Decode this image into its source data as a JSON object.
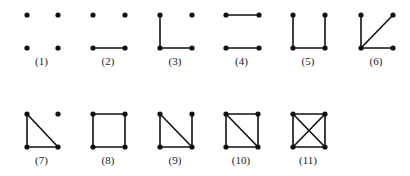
{
  "diagram": {
    "vertex_color": "#111111",
    "edge_color": "#111111",
    "graphs": [
      {
        "label": "(1)",
        "x": [
          27,
          58
        ],
        "y": [
          15,
          48
        ],
        "edges": []
      },
      {
        "label": "(2)",
        "x": [
          93,
          125
        ],
        "y": [
          15,
          48
        ],
        "edges": [
          [
            "BL",
            "BR"
          ]
        ]
      },
      {
        "label": "(3)",
        "x": [
          160,
          192
        ],
        "y": [
          15,
          48
        ],
        "edges": [
          [
            "TL",
            "BL"
          ],
          [
            "BL",
            "BR"
          ]
        ]
      },
      {
        "label": "(4)",
        "x": [
          226,
          259
        ],
        "y": [
          15,
          48
        ],
        "edges": [
          [
            "TL",
            "TR"
          ],
          [
            "BL",
            "BR"
          ]
        ]
      },
      {
        "label": "(5)",
        "x": [
          293,
          325
        ],
        "y": [
          15,
          48
        ],
        "edges": [
          [
            "TL",
            "BL"
          ],
          [
            "BL",
            "BR"
          ],
          [
            "BR",
            "TR"
          ]
        ]
      },
      {
        "label": "(6)",
        "x": [
          361,
          393
        ],
        "y": [
          15,
          48
        ],
        "edges": [
          [
            "TL",
            "BL"
          ],
          [
            "BL",
            "BR"
          ],
          [
            "BL",
            "TR"
          ]
        ]
      },
      {
        "label": "(7)",
        "x": [
          27,
          58
        ],
        "y": [
          114,
          147
        ],
        "edges": [
          [
            "TL",
            "BL"
          ],
          [
            "BL",
            "BR"
          ],
          [
            "TL",
            "BR"
          ]
        ]
      },
      {
        "label": "(8)",
        "x": [
          93,
          125
        ],
        "y": [
          114,
          147
        ],
        "edges": [
          [
            "TL",
            "TR"
          ],
          [
            "TR",
            "BR"
          ],
          [
            "BR",
            "BL"
          ],
          [
            "BL",
            "TL"
          ]
        ]
      },
      {
        "label": "(9)",
        "x": [
          160,
          192
        ],
        "y": [
          114,
          147
        ],
        "edges": [
          [
            "TL",
            "BL"
          ],
          [
            "BL",
            "BR"
          ],
          [
            "TL",
            "BR"
          ],
          [
            "TR",
            "BR"
          ]
        ]
      },
      {
        "label": "(10)",
        "x": [
          226,
          258
        ],
        "y": [
          114,
          147
        ],
        "edges": [
          [
            "TL",
            "TR"
          ],
          [
            "TR",
            "BR"
          ],
          [
            "BR",
            "BL"
          ],
          [
            "BL",
            "TL"
          ],
          [
            "TL",
            "BR"
          ]
        ]
      },
      {
        "label": "(11)",
        "x": [
          293,
          325
        ],
        "y": [
          114,
          147
        ],
        "edges": [
          [
            "TL",
            "TR"
          ],
          [
            "TR",
            "BR"
          ],
          [
            "BR",
            "BL"
          ],
          [
            "BL",
            "TL"
          ],
          [
            "TL",
            "BR"
          ],
          [
            "TR",
            "BL"
          ]
        ]
      }
    ]
  }
}
